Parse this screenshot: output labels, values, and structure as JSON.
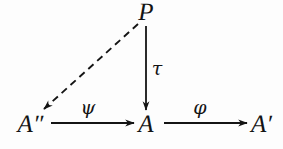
{
  "figure": {
    "kind": "commutative-diagram",
    "background_color": "#fdfdfd",
    "ink_color": "#141414",
    "width": 283,
    "height": 149
  },
  "nodes": [
    {
      "id": "P",
      "label": "P",
      "x": 146,
      "y": 12
    },
    {
      "id": "App",
      "label": "A",
      "prime": "″",
      "x": 22,
      "y": 124
    },
    {
      "id": "A",
      "label": "A",
      "x": 146,
      "y": 124
    },
    {
      "id": "Ap",
      "label": "A",
      "prime": "′",
      "x": 255,
      "y": 124
    }
  ],
  "arrows": [
    {
      "id": "p-to-app",
      "from": "P",
      "to": "App",
      "style": "dashed",
      "label": "",
      "x1": 138,
      "y1": 24,
      "x2": 44,
      "y2": 109
    },
    {
      "id": "p-to-a",
      "from": "P",
      "to": "A",
      "style": "solid",
      "label": "τ",
      "label_name": "tau",
      "label_x": 157,
      "label_y": 68,
      "x1": 146,
      "y1": 26,
      "x2": 146,
      "y2": 110
    },
    {
      "id": "app-to-a",
      "from": "App",
      "to": "A",
      "style": "solid",
      "label": "ψ",
      "label_name": "psi",
      "label_x": 88,
      "label_y": 107,
      "x1": 51,
      "y1": 123,
      "x2": 134,
      "y2": 123
    },
    {
      "id": "a-to-ap",
      "from": "A",
      "to": "Ap",
      "style": "solid",
      "label": "φ",
      "label_name": "phi",
      "label_x": 200,
      "label_y": 107,
      "x1": 164,
      "y1": 123,
      "x2": 247,
      "y2": 123
    }
  ]
}
